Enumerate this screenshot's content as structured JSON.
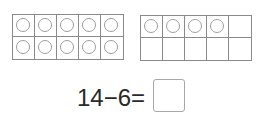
{
  "ten_frames": [
    {
      "name": "ten-frame-1",
      "filled": [
        1,
        1,
        1,
        1,
        1,
        1,
        1,
        1,
        1,
        1
      ]
    },
    {
      "name": "ten-frame-2",
      "filled": [
        1,
        1,
        1,
        1,
        0,
        0,
        0,
        0,
        0,
        0
      ]
    }
  ],
  "equation": {
    "text": "14−6=",
    "answer": ""
  },
  "colors": {
    "grid_line": "#8a8a8a",
    "counter": "#a0a0a0",
    "text": "#2a2a2a"
  }
}
